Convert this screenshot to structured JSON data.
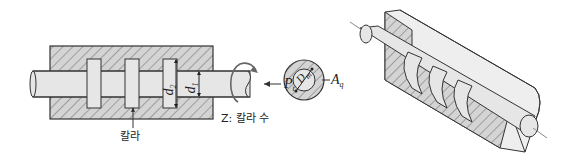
{
  "figure": {
    "type": "mechanical-diagram",
    "colors": {
      "line": "#333333",
      "fill": "#e6e6e6",
      "hatch_bg": "#d4d4d4",
      "background": "#ffffff"
    }
  },
  "section_view": {
    "collar_label": "칼라",
    "collar_count_label": "Z: 칼라 수",
    "d2": {
      "symbol": "d",
      "sub": "2"
    },
    "d1": {
      "symbol": "d",
      "sub": "1"
    },
    "force": {
      "symbol": "P",
      "sub": "t"
    }
  },
  "collar_face_view": {
    "mean_diameter": {
      "symbol": "D",
      "sub": "m"
    },
    "area": {
      "symbol": "A",
      "sub": "q"
    }
  },
  "isometric_view": {
    "collars": 3
  }
}
